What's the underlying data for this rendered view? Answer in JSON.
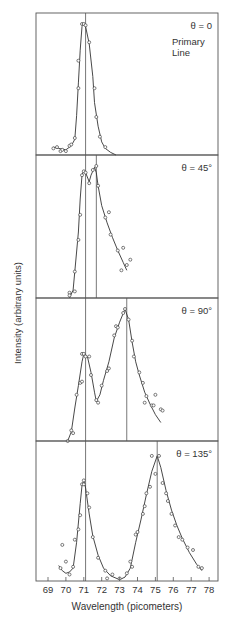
{
  "chart_data": {
    "type": "line",
    "title": "",
    "xlabel": "Wavelength (picometers)",
    "ylabel": "Intensity (arbitrary units)",
    "xlim": [
      68.3,
      78.5
    ],
    "x_ticks": [
      69,
      70,
      71,
      72,
      73,
      74,
      75,
      76,
      77,
      78
    ],
    "grid": false,
    "legend": "none",
    "layout": "4 vertically stacked panels sharing x-axis",
    "panels": [
      {
        "label": "θ = 0",
        "sublabel": [
          "Primary",
          "Line"
        ],
        "reference_lines": [
          71.1
        ],
        "points": [
          [
            69.3,
            0.05
          ],
          [
            69.5,
            0.06
          ],
          [
            69.7,
            0.03
          ],
          [
            69.8,
            0.04
          ],
          [
            70.0,
            0.03
          ],
          [
            70.2,
            0.07
          ],
          [
            70.3,
            0.08
          ],
          [
            70.5,
            0.13
          ],
          [
            70.7,
            0.51
          ],
          [
            70.7,
            0.72
          ],
          [
            70.9,
            1.0
          ],
          [
            71.0,
            1.0
          ],
          [
            71.1,
            0.99
          ],
          [
            71.3,
            0.86
          ],
          [
            71.6,
            0.51
          ],
          [
            71.7,
            0.29
          ],
          [
            71.9,
            0.14
          ],
          [
            72.2,
            0.06
          ]
        ],
        "curve": [
          [
            69.3,
            0.06
          ],
          [
            69.6,
            0.05
          ],
          [
            70.0,
            0.04
          ],
          [
            70.3,
            0.07
          ],
          [
            70.5,
            0.12
          ],
          [
            70.6,
            0.3
          ],
          [
            70.7,
            0.55
          ],
          [
            70.8,
            0.8
          ],
          [
            70.9,
            0.98
          ],
          [
            71.0,
            1.0
          ],
          [
            71.1,
            0.98
          ],
          [
            71.3,
            0.85
          ],
          [
            71.5,
            0.6
          ],
          [
            71.6,
            0.4
          ],
          [
            71.8,
            0.22
          ],
          [
            72.0,
            0.1
          ],
          [
            72.2,
            0.05
          ],
          [
            72.5,
            0.02
          ],
          [
            72.8,
            0.0
          ]
        ]
      },
      {
        "label": "θ = 45°",
        "reference_lines": [
          71.1,
          71.7
        ],
        "points": [
          [
            70.2,
            0.04
          ],
          [
            70.2,
            0.02
          ],
          [
            70.5,
            0.05
          ],
          [
            70.5,
            0.2
          ],
          [
            70.7,
            0.44
          ],
          [
            70.8,
            0.63
          ],
          [
            70.9,
            0.93
          ],
          [
            71.0,
            0.96
          ],
          [
            71.1,
            0.95
          ],
          [
            71.3,
            0.87
          ],
          [
            71.5,
            0.97
          ],
          [
            71.7,
            1.0
          ],
          [
            71.8,
            0.85
          ],
          [
            72.2,
            0.61
          ],
          [
            72.4,
            0.65
          ],
          [
            72.5,
            0.48
          ],
          [
            72.9,
            0.36
          ],
          [
            73.2,
            0.38
          ],
          [
            73.1,
            0.21
          ],
          [
            73.4,
            0.25
          ],
          [
            73.6,
            0.29
          ]
        ],
        "curve": [
          [
            70.2,
            0.0
          ],
          [
            70.4,
            0.06
          ],
          [
            70.5,
            0.2
          ],
          [
            70.7,
            0.5
          ],
          [
            70.8,
            0.75
          ],
          [
            70.9,
            0.93
          ],
          [
            71.0,
            0.97
          ],
          [
            71.1,
            0.95
          ],
          [
            71.3,
            0.88
          ],
          [
            71.4,
            0.93
          ],
          [
            71.6,
            0.99
          ],
          [
            71.7,
            0.95
          ],
          [
            71.8,
            0.85
          ],
          [
            72.0,
            0.7
          ],
          [
            72.3,
            0.57
          ],
          [
            72.6,
            0.46
          ],
          [
            72.9,
            0.36
          ],
          [
            73.2,
            0.27
          ],
          [
            73.4,
            0.21
          ]
        ]
      },
      {
        "label": "θ = 90°",
        "reference_lines": [
          71.1,
          73.4
        ],
        "points": [
          [
            70.1,
            0.0
          ],
          [
            70.3,
            0.08
          ],
          [
            70.4,
            0.06
          ],
          [
            70.6,
            0.35
          ],
          [
            70.8,
            0.44
          ],
          [
            70.9,
            0.45
          ],
          [
            70.9,
            0.66
          ],
          [
            71.0,
            0.66
          ],
          [
            71.1,
            0.64
          ],
          [
            71.3,
            0.64
          ],
          [
            71.4,
            0.5
          ],
          [
            71.7,
            0.31
          ],
          [
            71.8,
            0.29
          ],
          [
            72.0,
            0.42
          ],
          [
            72.3,
            0.53
          ],
          [
            72.4,
            0.55
          ],
          [
            72.7,
            0.8
          ],
          [
            72.8,
            0.87
          ],
          [
            72.9,
            0.86
          ],
          [
            73.2,
            0.97
          ],
          [
            73.3,
            1.0
          ],
          [
            73.5,
            0.92
          ],
          [
            73.7,
            0.76
          ],
          [
            73.8,
            0.64
          ],
          [
            74.1,
            0.52
          ],
          [
            74.3,
            0.44
          ],
          [
            74.5,
            0.34
          ],
          [
            74.4,
            0.29
          ],
          [
            74.8,
            0.27
          ],
          [
            74.9,
            0.27
          ],
          [
            75.0,
            0.35
          ],
          [
            75.3,
            0.24
          ],
          [
            75.4,
            0.23
          ]
        ],
        "curve": [
          [
            70.1,
            0.0
          ],
          [
            70.3,
            0.07
          ],
          [
            70.5,
            0.25
          ],
          [
            70.7,
            0.42
          ],
          [
            70.9,
            0.6
          ],
          [
            71.0,
            0.66
          ],
          [
            71.2,
            0.64
          ],
          [
            71.4,
            0.52
          ],
          [
            71.6,
            0.37
          ],
          [
            71.7,
            0.3
          ],
          [
            71.9,
            0.35
          ],
          [
            72.1,
            0.46
          ],
          [
            72.4,
            0.6
          ],
          [
            72.7,
            0.78
          ],
          [
            73.0,
            0.9
          ],
          [
            73.3,
            1.0
          ],
          [
            73.5,
            0.92
          ],
          [
            73.7,
            0.75
          ],
          [
            73.9,
            0.6
          ],
          [
            74.1,
            0.5
          ],
          [
            74.4,
            0.37
          ],
          [
            74.7,
            0.28
          ],
          [
            75.0,
            0.2
          ],
          [
            75.3,
            0.14
          ]
        ]
      },
      {
        "label": "θ = 135°",
        "reference_lines": [
          71.1,
          75.1
        ],
        "points": [
          [
            69.7,
            0.1
          ],
          [
            69.8,
            0.28
          ],
          [
            70.0,
            0.15
          ],
          [
            70.2,
            0.05
          ],
          [
            70.4,
            0.11
          ],
          [
            70.5,
            0.32
          ],
          [
            70.7,
            0.4
          ],
          [
            70.8,
            0.51
          ],
          [
            70.9,
            0.75
          ],
          [
            71.0,
            0.78
          ],
          [
            71.0,
            0.75
          ],
          [
            71.2,
            0.68
          ],
          [
            71.3,
            0.57
          ],
          [
            71.5,
            0.34
          ],
          [
            71.8,
            0.18
          ],
          [
            72.2,
            0.08
          ],
          [
            72.3,
            0.02
          ],
          [
            72.6,
            0.05
          ],
          [
            73.0,
            0.02
          ],
          [
            73.4,
            0.06
          ],
          [
            73.6,
            0.15
          ],
          [
            73.7,
            0.11
          ],
          [
            73.9,
            0.36
          ],
          [
            74.0,
            0.38
          ],
          [
            74.3,
            0.52
          ],
          [
            74.4,
            0.58
          ],
          [
            74.5,
            0.68
          ],
          [
            74.7,
            0.73
          ],
          [
            74.8,
            0.97
          ],
          [
            75.2,
            0.97
          ],
          [
            75.0,
            0.83
          ],
          [
            75.4,
            0.76
          ],
          [
            75.6,
            0.68
          ],
          [
            75.7,
            0.62
          ],
          [
            75.9,
            0.52
          ],
          [
            76.1,
            0.43
          ],
          [
            76.3,
            0.34
          ],
          [
            76.5,
            0.32
          ],
          [
            76.8,
            0.26
          ],
          [
            77.1,
            0.24
          ],
          [
            77.4,
            0.11
          ],
          [
            77.6,
            0.1
          ]
        ],
        "curve": [
          [
            69.6,
            0.12
          ],
          [
            69.8,
            0.08
          ],
          [
            70.0,
            0.06
          ],
          [
            70.2,
            0.07
          ],
          [
            70.4,
            0.1
          ],
          [
            70.6,
            0.3
          ],
          [
            70.8,
            0.6
          ],
          [
            70.9,
            0.74
          ],
          [
            71.0,
            0.78
          ],
          [
            71.1,
            0.72
          ],
          [
            71.3,
            0.52
          ],
          [
            71.5,
            0.35
          ],
          [
            71.8,
            0.2
          ],
          [
            72.1,
            0.1
          ],
          [
            72.5,
            0.04
          ],
          [
            73.0,
            0.01
          ],
          [
            73.3,
            0.03
          ],
          [
            73.6,
            0.1
          ],
          [
            73.9,
            0.3
          ],
          [
            74.2,
            0.48
          ],
          [
            74.5,
            0.67
          ],
          [
            74.8,
            0.85
          ],
          [
            75.1,
            0.97
          ],
          [
            75.3,
            0.88
          ],
          [
            75.6,
            0.7
          ],
          [
            75.9,
            0.55
          ],
          [
            76.2,
            0.43
          ],
          [
            76.5,
            0.33
          ],
          [
            76.9,
            0.22
          ],
          [
            77.3,
            0.13
          ],
          [
            77.6,
            0.08
          ]
        ]
      }
    ]
  }
}
